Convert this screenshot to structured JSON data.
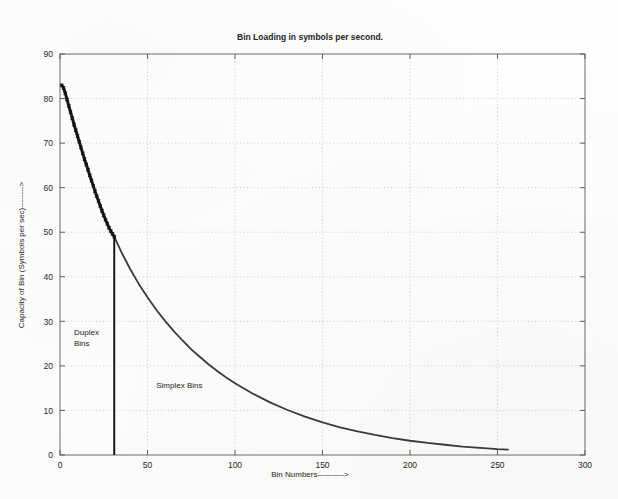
{
  "chart_data": {
    "type": "line",
    "title": "Bin Loading in symbols per second.",
    "xlabel": "Bin Numbers---------->",
    "ylabel": "Capacity of Bin (Symbols per sec)-------->",
    "xlim": [
      0,
      300
    ],
    "ylim": [
      0,
      90
    ],
    "xticks": [
      0,
      50,
      100,
      150,
      200,
      250,
      300
    ],
    "yticks": [
      0,
      10,
      20,
      30,
      40,
      50,
      60,
      70,
      80,
      90
    ],
    "grid": true,
    "legend": "none",
    "annotations": [
      {
        "text": "Duplex Bins",
        "x": 8,
        "y": 27
      },
      {
        "text": "Simplex Bins",
        "x": 55,
        "y": 15
      }
    ],
    "divider": {
      "x": 31,
      "y_top": 49,
      "y_bottom": 0
    },
    "series": [
      {
        "name": "Duplex Bins",
        "style": "thick-marker-line",
        "x": [
          1,
          2,
          3,
          4,
          5,
          6,
          7,
          8,
          9,
          10,
          11,
          12,
          13,
          14,
          15,
          16,
          17,
          18,
          19,
          20,
          21,
          22,
          23,
          24,
          25,
          26,
          27,
          28,
          29,
          30,
          31
        ],
        "values": [
          83.0,
          82.4,
          81.2,
          79.8,
          78.4,
          77.0,
          75.6,
          74.2,
          72.9,
          71.6,
          70.3,
          69.0,
          67.7,
          66.4,
          65.2,
          64.0,
          62.8,
          61.6,
          60.4,
          59.2,
          58.1,
          57.0,
          55.9,
          54.8,
          53.8,
          52.8,
          51.9,
          51.0,
          50.3,
          49.6,
          49.0
        ]
      },
      {
        "name": "Simplex Bins",
        "style": "thin-line",
        "x": [
          31,
          35,
          40,
          45,
          50,
          55,
          60,
          65,
          70,
          75,
          80,
          85,
          90,
          95,
          100,
          110,
          120,
          130,
          140,
          150,
          160,
          170,
          180,
          190,
          200,
          210,
          220,
          230,
          240,
          250,
          256
        ],
        "values": [
          49.0,
          45.6,
          41.8,
          38.4,
          35.4,
          32.6,
          30.1,
          27.8,
          25.7,
          23.7,
          22.0,
          20.3,
          18.8,
          17.4,
          16.1,
          13.8,
          11.8,
          10.1,
          8.6,
          7.3,
          6.2,
          5.3,
          4.5,
          3.8,
          3.2,
          2.7,
          2.3,
          1.9,
          1.6,
          1.3,
          1.2
        ]
      }
    ]
  },
  "colors": {
    "duplex_line": "#1a1a1a",
    "simplex_line": "#3a3a3a",
    "grid": "#bdbdbd",
    "axis": "#6b6b6b",
    "background": "#fdfdfc"
  }
}
